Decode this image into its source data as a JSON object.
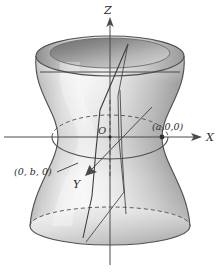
{
  "figure": {
    "kind": "hyperboloid-of-one-sheet",
    "background_color": "#ffffff",
    "line_color": "#4a4a4a",
    "surface_light": "#fdfdfd",
    "surface_mid": "#d2d2d2",
    "surface_dark": "#8e8e8e",
    "surface_shadow": "#6f6f6f"
  },
  "axes": {
    "z_label": "Z",
    "x_label": "X",
    "y_label": "Y",
    "origin_label": "O"
  },
  "points": {
    "x_intercept_label": "(a,0,0)",
    "y_intercept_label": "(0, b, 0)"
  }
}
